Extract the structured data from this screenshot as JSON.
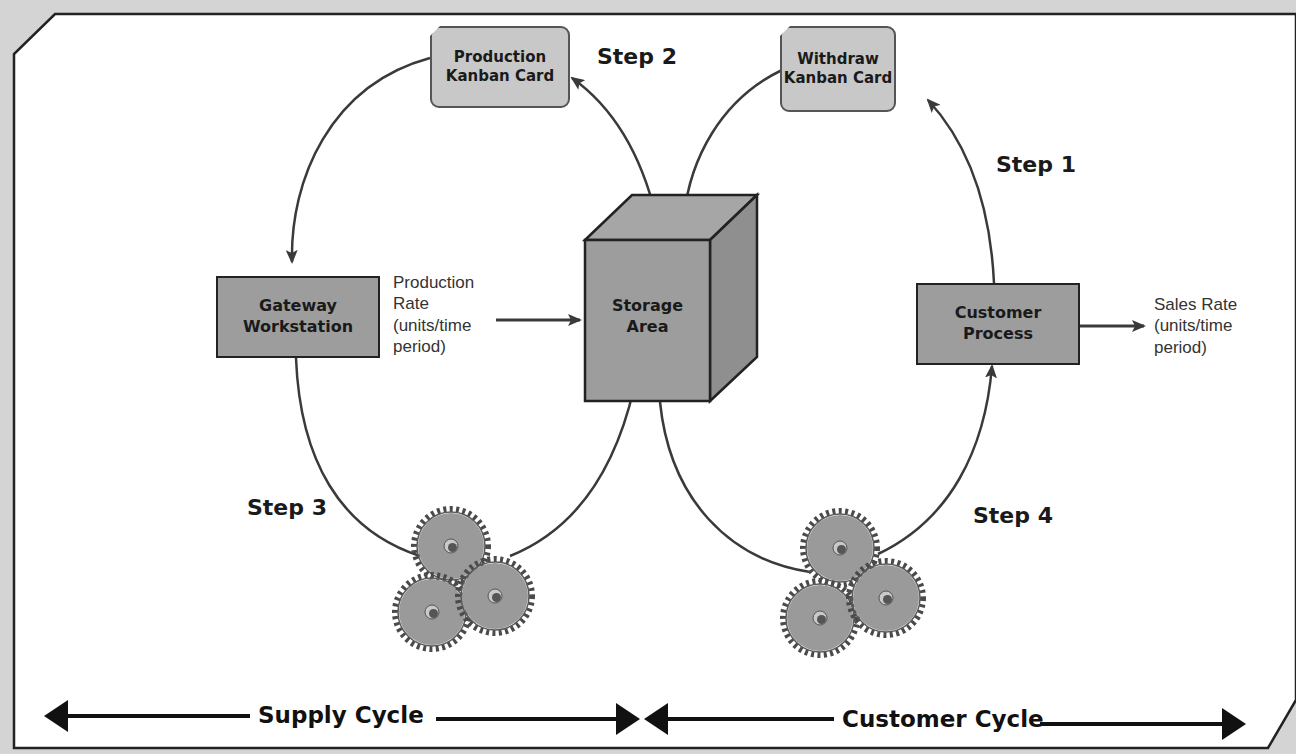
{
  "diagram": {
    "cards": {
      "production": "Production Kanban Card",
      "production_line1": "Production",
      "production_line2": "Kanban Card",
      "withdraw": "Withdraw Kanban Card",
      "withdraw_line1": "Withdraw",
      "withdraw_line2": "Kanban Card"
    },
    "nodes": {
      "gateway_line1": "Gateway",
      "gateway_line2": "Workstation",
      "storage_line1": "Storage",
      "storage_line2": "Area",
      "customer_line1": "Customer",
      "customer_line2": "Process"
    },
    "rates": {
      "production": [
        "Production",
        "Rate",
        "(units/time",
        "period)"
      ],
      "sales": [
        "Sales Rate",
        "(units/time",
        "period)"
      ]
    },
    "steps": {
      "step1": "Step 1",
      "step2": "Step 2",
      "step3": "Step 3",
      "step4": "Step 4"
    },
    "cycles": {
      "supply": "Supply Cycle",
      "customer": "Customer Cycle"
    },
    "colors": {
      "background": "#d4d4d4",
      "panel": "#ffffff",
      "card_fill": "#c8c8c8",
      "box_fill": "#9d9d9d",
      "gear_fill": "#9a9a9a",
      "line": "#3a3a3a"
    }
  }
}
